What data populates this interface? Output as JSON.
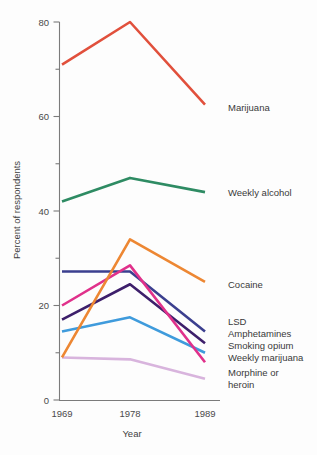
{
  "chart_data": {
    "type": "line",
    "title": "",
    "xlabel": "Year",
    "ylabel": "Percent of respondents",
    "categories": [
      "1969",
      "1978",
      "1989"
    ],
    "x": [
      1969,
      1978,
      1989
    ],
    "xlim": [
      1969,
      1989
    ],
    "ylim": [
      0,
      80
    ],
    "yticks_major": [
      0,
      20,
      40,
      60,
      80
    ],
    "yticks_minor": [
      10,
      30,
      50,
      70
    ],
    "ytick_labels": [
      "0",
      "20",
      "40",
      "60",
      "80"
    ],
    "xtick_labels": [
      "1969",
      "1978",
      "1989"
    ],
    "grid": false,
    "legend_position": "right-inline-at-line-end",
    "series": [
      {
        "name": "Marijuana",
        "color": "#e1503c",
        "values": [
          71,
          80,
          62.5
        ],
        "label_y": 62.5
      },
      {
        "name": "Weekly alcohol",
        "color": "#2e8b63",
        "values": [
          42,
          47,
          44
        ],
        "label_y": 44
      },
      {
        "name": "Cocaine",
        "color": "#ed8733",
        "values": [
          9,
          34,
          25
        ],
        "label_y": 25
      },
      {
        "name": "LSD",
        "color": "#3b3f8f",
        "values": [
          27.2,
          27.2,
          14.5
        ],
        "label_y": 14.5
      },
      {
        "name": "Amphetamines",
        "color": "#3d1f6b",
        "values": [
          17,
          24.5,
          12
        ],
        "label_y": 12
      },
      {
        "name": "Smoking opium",
        "color": "#3f9bdc",
        "values": [
          14.5,
          17.5,
          10
        ],
        "label_y": 10
      },
      {
        "name": "Weekly marijuana",
        "color": "#e0318b",
        "values": [
          20,
          28.5,
          8
        ],
        "label_y": 8
      },
      {
        "name": "Morphine or heroin",
        "color": "#d8b4dd",
        "values": [
          9,
          8.6,
          4.5
        ],
        "label_y": 4.5,
        "label_lines": [
          "Morphine or",
          "heroin"
        ]
      }
    ]
  },
  "axes": {
    "y_axis_title": "Percent of respondents",
    "x_axis_title": "Year"
  },
  "labels": {
    "marijuana": "Marijuana",
    "weekly_alcohol": "Weekly alcohol",
    "cocaine": "Cocaine",
    "lsd": "LSD",
    "amphetamines": "Amphetamines",
    "smoking_opium": "Smoking opium",
    "weekly_marijuana": "Weekly marijuana",
    "morphine_line1": "Morphine or",
    "morphine_line2": "heroin"
  },
  "ticks": {
    "y0": "0",
    "y20": "20",
    "y40": "40",
    "y60": "60",
    "y80": "80",
    "x1969": "1969",
    "x1978": "1978",
    "x1989": "1989"
  }
}
